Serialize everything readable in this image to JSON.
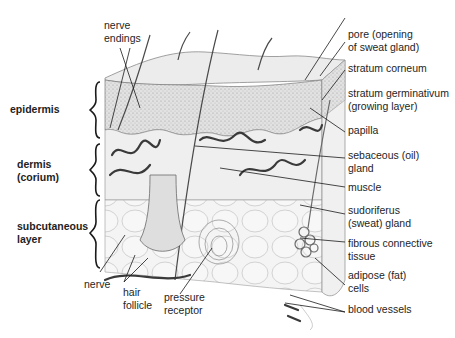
{
  "diagram": {
    "layers": [
      {
        "id": "epidermis",
        "label": "epidermis"
      },
      {
        "id": "dermis",
        "label": "dermis\n(corium)"
      },
      {
        "id": "subcutaneous",
        "label": "subcutaneous\nlayer"
      }
    ],
    "labels": {
      "nerve_endings": "nerve\nendings",
      "pore": "pore (opening\nof sweat gland)",
      "stratum_corneum": "stratum corneum",
      "stratum_germinativum": "stratum germinativum\n(growing layer)",
      "papilla": "papilla",
      "sebaceous_gland": "sebaceous (oil)\ngland",
      "muscle": "muscle",
      "sudoriferus_gland": "sudoriferus\n(sweat) gland",
      "fibrous_tissue": "fibrous connective\ntissue",
      "adipose_cells": "adipose (fat)\ncells",
      "blood_vessels": "blood vessels",
      "nerve": "nerve",
      "hair_follicle": "hair\nfollicle",
      "pressure_receptor": "pressure\nreceptor"
    },
    "colors": {
      "ink": "#2a2a2a",
      "surface": "#e9e9e9",
      "epidermis_fill": "#dcdcdc",
      "dermis_fill": "#eeeeee",
      "fat_fill": "#f3f3f3",
      "vessel": "#3c3c3c"
    }
  }
}
